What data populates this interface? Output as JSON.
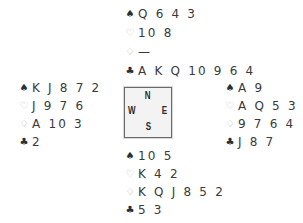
{
  "hands": {
    "north": {
      "spades": "Q 6 4 3",
      "hearts": "10 8",
      "diamonds": "—",
      "clubs": "A K Q 10 9 6 4"
    },
    "west": {
      "spades": "K J 8 7 2",
      "hearts": "J 9 7 6",
      "diamonds": "A 10 3",
      "clubs": "2"
    },
    "east": {
      "spades": "A 9",
      "hearts": "A Q 5 3",
      "diamonds": "9 7 6 4",
      "clubs": "J 8 7"
    },
    "south": {
      "spades": "10 5",
      "hearts": "K 4 2",
      "diamonds": "K Q J 8 5 2",
      "clubs": "5 3"
    }
  },
  "suits": {
    "spades": "♠",
    "hearts": "♡",
    "diamonds": "♢",
    "clubs": "♣"
  },
  "compass": {
    "north": "N",
    "west": "W",
    "east": "E",
    "south": "S"
  },
  "colors": {
    "black_suit": "#2e2e2e",
    "red_suit_outline": "#b5b5b5",
    "compass_fill": "#f3f3f3",
    "compass_border": "#6a6a6a"
  }
}
